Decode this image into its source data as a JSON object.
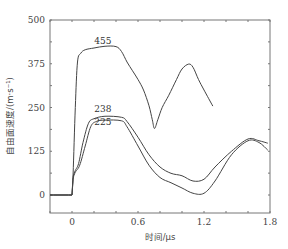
{
  "chart_data": {
    "type": "line",
    "title": "",
    "xlabel": "时间/μs",
    "ylabel": "自由面速度/(m·s⁻¹)",
    "xlim": [
      -0.2,
      1.8
    ],
    "ylim": [
      -50,
      500
    ],
    "xticks": [
      "0",
      "0.6",
      "1.2",
      "1.8"
    ],
    "yticks": [
      "0",
      "125",
      "250",
      "375",
      "500"
    ],
    "grid": false,
    "legend": "none (curves annotated inline with peak values)",
    "annotations": [
      {
        "text": "455",
        "x": 0.28,
        "y": 440
      },
      {
        "text": "238",
        "x": 0.28,
        "y": 245
      },
      {
        "text": "225",
        "x": 0.28,
        "y": 208
      }
    ],
    "series": [
      {
        "name": "455",
        "x": [
          -0.2,
          0.0,
          0.01,
          0.03,
          0.05,
          0.08,
          0.12,
          0.2,
          0.3,
          0.4,
          0.45,
          0.5,
          0.55,
          0.6,
          0.65,
          0.7,
          0.73,
          0.75,
          0.78,
          0.82,
          0.88,
          0.95,
          1.0,
          1.06,
          1.1,
          1.15,
          1.2,
          1.28
        ],
        "y": [
          0,
          0,
          60,
          250,
          380,
          405,
          415,
          420,
          425,
          424,
          410,
          380,
          355,
          330,
          300,
          255,
          215,
          190,
          215,
          250,
          285,
          330,
          360,
          374,
          365,
          330,
          300,
          254
        ]
      },
      {
        "name": "238",
        "x": [
          -0.2,
          0.0,
          0.01,
          0.03,
          0.06,
          0.1,
          0.15,
          0.2,
          0.3,
          0.45,
          0.5,
          0.6,
          0.7,
          0.8,
          0.9,
          1.0,
          1.1,
          1.2,
          1.3,
          1.45,
          1.6,
          1.7,
          1.78
        ],
        "y": [
          0,
          0,
          50,
          70,
          90,
          150,
          205,
          218,
          225,
          222,
          210,
          165,
          115,
          80,
          62,
          55,
          40,
          45,
          80,
          125,
          160,
          155,
          148
        ]
      },
      {
        "name": "225",
        "x": [
          -0.2,
          0.0,
          0.01,
          0.03,
          0.07,
          0.12,
          0.17,
          0.22,
          0.3,
          0.45,
          0.5,
          0.6,
          0.7,
          0.8,
          0.9,
          1.0,
          1.1,
          1.2,
          1.3,
          1.45,
          1.6,
          1.7,
          1.78
        ],
        "y": [
          0,
          0,
          45,
          65,
          85,
          140,
          195,
          210,
          214,
          212,
          195,
          140,
          85,
          50,
          35,
          20,
          5,
          5,
          40,
          115,
          155,
          150,
          128
        ]
      }
    ]
  },
  "axes": {
    "xlabel": "时间/μs",
    "ylabel": "自由面速度/(m·s⁻¹)"
  }
}
